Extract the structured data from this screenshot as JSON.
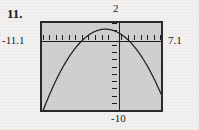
{
  "exercise": {
    "number_label": "11."
  },
  "window_labels": {
    "y_max": "2",
    "y_min": "-10",
    "x_min": "-11.1",
    "x_max": "7.1"
  },
  "colors": {
    "page_background": "#f3f1ef",
    "screen_background": "#d1d1d1",
    "screen_border": "#2a2a2a",
    "curve": "#1f1f1f",
    "axis": "#1f1f1f",
    "text": "#1b1b1b"
  },
  "chart_data": {
    "type": "line",
    "title": "",
    "xlabel": "",
    "ylabel": "",
    "xlim": [
      -11.1,
      7.1
    ],
    "ylim": [
      -10,
      2
    ],
    "x_tick_interval": 1,
    "y_tick_interval": 1,
    "grid": false,
    "legend": false,
    "axes_shown": [
      "x-axis",
      "y-axis"
    ],
    "series": [
      {
        "name": "parabola",
        "shape": "downward-opening parabola",
        "vertex": [
          -1.4,
          1.15
        ],
        "x_intercepts": [
          -5.4,
          1.65
        ],
        "y_intercept": 0.85,
        "x": [
          -9.3,
          -8.5,
          -7.5,
          -6.5,
          -5.4,
          -4.5,
          -3.5,
          -2.5,
          -1.4,
          -0.5,
          0.5,
          1.65,
          2.5,
          3.5,
          4.3
        ],
        "y": [
          -9.9,
          -7.5,
          -4.9,
          -2.7,
          0.0,
          1.0,
          1.0,
          1.0,
          1.15,
          1.0,
          0.9,
          0.0,
          -1.5,
          -5.2,
          -9.3
        ]
      }
    ]
  }
}
